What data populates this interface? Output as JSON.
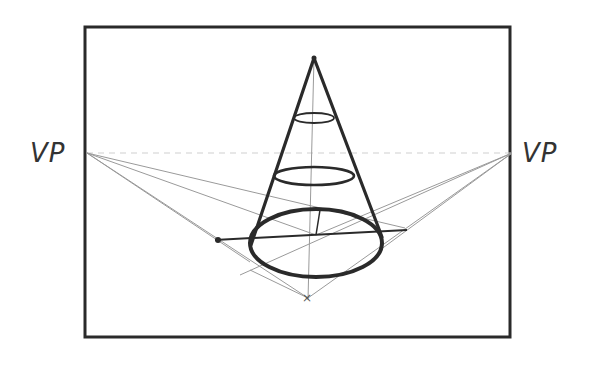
{
  "diagram": {
    "labels": {
      "vp_left": "VP",
      "vp_right": "VP"
    },
    "colors": {
      "ink": "#2a2a2a",
      "guide": "#9a9a9a",
      "background": "#ffffff"
    },
    "frame": {
      "x": 85,
      "y": 27,
      "width": 425,
      "height": 310
    },
    "vanishing_points": [
      {
        "name": "VP",
        "x": 87,
        "y": 153
      },
      {
        "name": "VP",
        "x": 512,
        "y": 153
      }
    ],
    "cone": {
      "apex": {
        "x": 314,
        "y": 58
      },
      "base_center": {
        "x": 316,
        "y": 235
      },
      "base_rx": 66,
      "base_ry": 35,
      "cross_sections": [
        {
          "cy": 118,
          "rx": 20,
          "ry": 5
        },
        {
          "cy": 176,
          "rx": 40,
          "ry": 9
        }
      ]
    }
  }
}
